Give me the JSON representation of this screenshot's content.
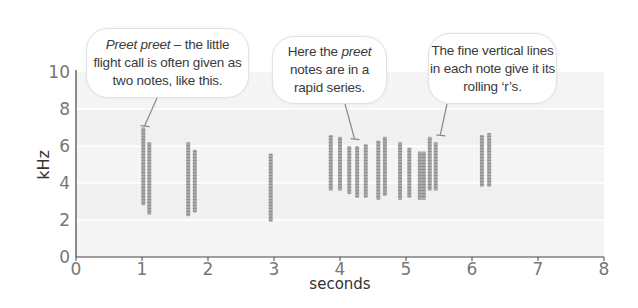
{
  "chart_data": {
    "type": "spectrogram",
    "title": "",
    "xlabel": "seconds",
    "ylabel": "kHz",
    "xlim": [
      0,
      8
    ],
    "ylim": [
      0,
      10
    ],
    "x_ticks": [
      0,
      1,
      2,
      3,
      4,
      5,
      6,
      7,
      8
    ],
    "y_ticks": [
      0,
      2,
      4,
      6,
      8,
      10
    ],
    "grid": "horizontal bands every 2 kHz",
    "notes": [
      {
        "t": 1.02,
        "f_low": 2.8,
        "f_high": 7.0
      },
      {
        "t": 1.11,
        "f_low": 2.3,
        "f_high": 6.2
      },
      {
        "t": 1.7,
        "f_low": 2.2,
        "f_high": 6.2
      },
      {
        "t": 1.8,
        "f_low": 2.4,
        "f_high": 5.8
      },
      {
        "t": 2.95,
        "f_low": 1.9,
        "f_high": 5.6
      },
      {
        "t": 3.86,
        "f_low": 3.6,
        "f_high": 6.6
      },
      {
        "t": 4.0,
        "f_low": 3.6,
        "f_high": 6.5
      },
      {
        "t": 4.14,
        "f_low": 3.4,
        "f_high": 6.0
      },
      {
        "t": 4.26,
        "f_low": 3.2,
        "f_high": 6.0
      },
      {
        "t": 4.39,
        "f_low": 3.2,
        "f_high": 6.1
      },
      {
        "t": 4.58,
        "f_low": 3.1,
        "f_high": 6.3
      },
      {
        "t": 4.68,
        "f_low": 3.3,
        "f_high": 6.5
      },
      {
        "t": 4.91,
        "f_low": 3.1,
        "f_high": 6.2
      },
      {
        "t": 5.05,
        "f_low": 3.2,
        "f_high": 5.9
      },
      {
        "t": 5.21,
        "f_low": 3.1,
        "f_high": 5.7
      },
      {
        "t": 5.27,
        "f_low": 3.1,
        "f_high": 5.7
      },
      {
        "t": 5.36,
        "f_low": 3.6,
        "f_high": 6.5
      },
      {
        "t": 5.45,
        "f_low": 3.6,
        "f_high": 6.2
      },
      {
        "t": 6.15,
        "f_low": 3.8,
        "f_high": 6.6
      },
      {
        "t": 6.26,
        "f_low": 3.8,
        "f_high": 6.7
      }
    ],
    "annotations": [
      {
        "id": "a1",
        "lines": [
          [
            "Preet preet",
            " – the little"
          ],
          [
            "flight call is often given as"
          ],
          [
            "two notes, like this."
          ]
        ],
        "italic_prefix": "Preet preet",
        "pointer_t": 1.04,
        "pointer_f": 7.1
      },
      {
        "id": "a2",
        "lines": [
          [
            "Here the ",
            "preet"
          ],
          [
            "notes are in a"
          ],
          [
            "rapid series."
          ]
        ],
        "italic_word": "preet",
        "pointer_t": 4.22,
        "pointer_f": 6.4
      },
      {
        "id": "a3",
        "lines": [
          [
            "The fine vertical lines"
          ],
          [
            "in each note give it its"
          ],
          [
            "rolling ‘r’s."
          ]
        ],
        "pointer_t": 5.52,
        "pointer_f": 6.6
      }
    ]
  },
  "colors": {
    "background": "#ffffff",
    "plot_band_light": "#f6f6f6",
    "plot_band_dark": "#efefef",
    "grid_line": "#ffffff",
    "note": "#8a8a8a",
    "axis": "#444444",
    "tick_label": "#777777",
    "axis_label": "#333333",
    "pointer": "#888888"
  },
  "labels": {
    "bubble1_italic": "Preet preet",
    "bubble1_rest": " – the little",
    "bubble1_line2": "flight call is often given as",
    "bubble1_line3": "two notes, like this.",
    "bubble2_line1a": "Here the ",
    "bubble2_line1b": "preet",
    "bubble2_line2": "notes are in a",
    "bubble2_line3": "rapid series.",
    "bubble3_line1": "The fine vertical lines",
    "bubble3_line2": "in each note give it its",
    "bubble3_line3": "rolling ‘r’s.",
    "xlabel": "seconds",
    "ylabel": "kHz"
  }
}
